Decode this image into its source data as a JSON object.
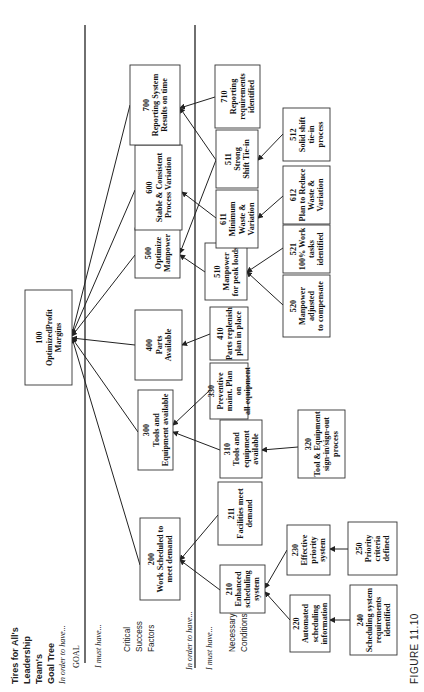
{
  "title_lines": [
    "Tires for All's",
    "Leadership",
    "Team's",
    "Goal Tree",
    "In order to have..."
  ],
  "labels": {
    "goal": "GOAL",
    "i_must_have_1": "I must have...",
    "csf": [
      "Critical",
      "Success",
      "Factors"
    ],
    "in_order_to_have_2": "In order to have...",
    "i_must_have_2": "I must have...",
    "nc": [
      "Necessary",
      "Conditions"
    ]
  },
  "figure_caption": "FIGURE 11.10",
  "nodes": [
    {
      "id": "100",
      "lines": [
        "100",
        "OptimizedProfit",
        "Margins"
      ],
      "x": 25,
      "y": 290,
      "w": 47,
      "h": 95
    },
    {
      "id": "200",
      "lines": [
        "200",
        "Work Scheduled to",
        "meet demand"
      ],
      "x": 140,
      "y": 518,
      "w": 40,
      "h": 82
    },
    {
      "id": "300",
      "lines": [
        "300",
        "Tools and",
        "Equipment  available"
      ],
      "x": 138,
      "y": 390,
      "w": 35,
      "h": 80
    },
    {
      "id": "400",
      "lines": [
        "400",
        "Parts",
        "Available"
      ],
      "x": 135,
      "y": 310,
      "w": 47,
      "h": 70
    },
    {
      "id": "500",
      "lines": [
        "500",
        "Optimize",
        "Manpower"
      ],
      "x": 135,
      "y": 228,
      "w": 45,
      "h": 50
    },
    {
      "id": "600",
      "lines": [
        "600",
        "Stable & Consistent",
        "Process Variation"
      ],
      "x": 135,
      "y": 145,
      "w": 47,
      "h": 85
    },
    {
      "id": "700",
      "lines": [
        "700",
        "Reporting System",
        "Results on time"
      ],
      "x": 130,
      "y": 65,
      "w": 50,
      "h": 80
    },
    {
      "id": "210",
      "lines": [
        "210",
        "Enhanced",
        "scheduling",
        "system"
      ],
      "x": 220,
      "y": 565,
      "w": 45,
      "h": 48
    },
    {
      "id": "211",
      "lines": [
        "211",
        "Facilities meet",
        "demand"
      ],
      "x": 218,
      "y": 482,
      "w": 44,
      "h": 63
    },
    {
      "id": "310",
      "lines": [
        "310",
        "Tools and",
        "equipment",
        "available"
      ],
      "x": 220,
      "y": 420,
      "w": 42,
      "h": 58
    },
    {
      "id": "330",
      "lines": [
        "330",
        "Preventive",
        "maint. Plan",
        "on",
        "all equipment"
      ],
      "x": 210,
      "y": 363,
      "w": 38,
      "h": 56
    },
    {
      "id": "410",
      "lines": [
        "410",
        "Parts replenish",
        "plan in place"
      ],
      "x": 210,
      "y": 307,
      "w": 38,
      "h": 53
    },
    {
      "id": "510",
      "lines": [
        "510",
        "Manpower",
        "for peak loads"
      ],
      "x": 205,
      "y": 243,
      "w": 42,
      "h": 57
    },
    {
      "id": "611",
      "lines": [
        "611",
        "Minimum",
        "Waste  &",
        "Variation"
      ],
      "x": 216,
      "y": 190,
      "w": 42,
      "h": 58
    },
    {
      "id": "511",
      "lines": [
        "511",
        "Strong",
        "Shift Tie-in"
      ],
      "x": 216,
      "y": 130,
      "w": 42,
      "h": 58
    },
    {
      "id": "710",
      "lines": [
        "710",
        "Reporting",
        "requirements",
        "identified"
      ],
      "x": 215,
      "y": 65,
      "w": 45,
      "h": 63
    },
    {
      "id": "220",
      "lines": [
        "220",
        "Automated",
        "scheduling",
        "information"
      ],
      "x": 290,
      "y": 595,
      "w": 40,
      "h": 57
    },
    {
      "id": "230",
      "lines": [
        "230",
        "Effective",
        "priority",
        "system"
      ],
      "x": 287,
      "y": 525,
      "w": 43,
      "h": 50
    },
    {
      "id": "320",
      "lines": [
        "320",
        "Tool & Equipment",
        "sign-in/sign-out",
        "process"
      ],
      "x": 298,
      "y": 410,
      "w": 47,
      "h": 68
    },
    {
      "id": "520",
      "lines": [
        "520",
        "Manpower",
        "adjusted",
        "to compensate"
      ],
      "x": 283,
      "y": 275,
      "w": 47,
      "h": 62
    },
    {
      "id": "521",
      "lines": [
        "521",
        "100% Work",
        "tasks",
        "identified"
      ],
      "x": 283,
      "y": 225,
      "w": 47,
      "h": 48
    },
    {
      "id": "612",
      "lines": [
        "612",
        "Plan to Reduce",
        "Waste &",
        "Variation"
      ],
      "x": 283,
      "y": 166,
      "w": 47,
      "h": 58
    },
    {
      "id": "512",
      "lines": [
        "512",
        "Solid shift",
        "tie-in",
        "process"
      ],
      "x": 283,
      "y": 108,
      "w": 47,
      "h": 53
    },
    {
      "id": "240",
      "lines": [
        "240",
        "Scheduling system",
        "requirements",
        "identified"
      ],
      "x": 350,
      "y": 585,
      "w": 47,
      "h": 70
    },
    {
      "id": "250",
      "lines": [
        "250",
        "Priority",
        "criteria",
        "defined"
      ],
      "x": 348,
      "y": 522,
      "w": 49,
      "h": 53
    }
  ],
  "connections": [
    {
      "from": "200",
      "to": "100",
      "x1": 140,
      "y1": 565,
      "x2": 72,
      "y2": 338
    },
    {
      "from": "300",
      "to": "100",
      "x1": 138,
      "y1": 432,
      "x2": 72,
      "y2": 338
    },
    {
      "from": "400",
      "to": "100",
      "x1": 135,
      "y1": 345,
      "x2": 72,
      "y2": 338
    },
    {
      "from": "500",
      "to": "100",
      "x1": 135,
      "y1": 255,
      "x2": 72,
      "y2": 336
    },
    {
      "from": "600",
      "to": "100",
      "x1": 135,
      "y1": 190,
      "x2": 72,
      "y2": 335
    },
    {
      "from": "700",
      "to": "100",
      "x1": 130,
      "y1": 105,
      "x2": 72,
      "y2": 334
    },
    {
      "from": "210",
      "to": "200",
      "x1": 220,
      "y1": 590,
      "x2": 180,
      "y2": 560
    },
    {
      "from": "211",
      "to": "200",
      "x1": 218,
      "y1": 515,
      "x2": 180,
      "y2": 560
    },
    {
      "from": "310",
      "to": "300",
      "x1": 220,
      "y1": 450,
      "x2": 173,
      "y2": 432
    },
    {
      "from": "330",
      "to": "300",
      "x1": 210,
      "y1": 390,
      "x2": 173,
      "y2": 425
    },
    {
      "from": "410",
      "to": "400",
      "x1": 210,
      "y1": 334,
      "x2": 182,
      "y2": 345
    },
    {
      "from": "510",
      "to": "500",
      "x1": 205,
      "y1": 272,
      "x2": 180,
      "y2": 255
    },
    {
      "from": "611",
      "to": "600",
      "x1": 216,
      "y1": 218,
      "x2": 182,
      "y2": 192
    },
    {
      "from": "511",
      "to": "500",
      "x1": 216,
      "y1": 160,
      "x2": 180,
      "y2": 253
    },
    {
      "from": "511",
      "to": "700",
      "x1": 216,
      "y1": 160,
      "x2": 180,
      "y2": 108
    },
    {
      "from": "710",
      "to": "700",
      "x1": 215,
      "y1": 97,
      "x2": 180,
      "y2": 108
    },
    {
      "from": "220",
      "to": "210",
      "x1": 290,
      "y1": 620,
      "x2": 265,
      "y2": 592
    },
    {
      "from": "230",
      "to": "210",
      "x1": 287,
      "y1": 550,
      "x2": 265,
      "y2": 588
    },
    {
      "from": "320",
      "to": "310",
      "x1": 298,
      "y1": 447,
      "x2": 262,
      "y2": 450
    },
    {
      "from": "520",
      "to": "510",
      "x1": 283,
      "y1": 305,
      "x2": 247,
      "y2": 272
    },
    {
      "from": "521",
      "to": "510",
      "x1": 283,
      "y1": 248,
      "x2": 247,
      "y2": 272
    },
    {
      "from": "612",
      "to": "611",
      "x1": 283,
      "y1": 196,
      "x2": 258,
      "y2": 218
    },
    {
      "from": "512",
      "to": "511",
      "x1": 283,
      "y1": 134,
      "x2": 258,
      "y2": 160
    },
    {
      "from": "240",
      "to": "220",
      "x1": 350,
      "y1": 620,
      "x2": 330,
      "y2": 620
    },
    {
      "from": "250",
      "to": "230",
      "x1": 348,
      "y1": 549,
      "x2": 330,
      "y2": 549
    }
  ]
}
